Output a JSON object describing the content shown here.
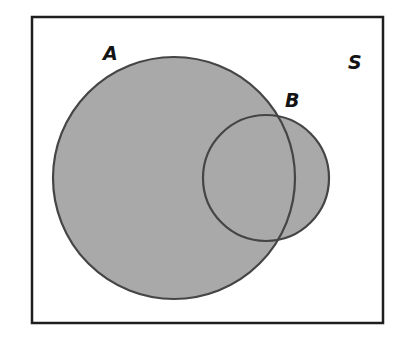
{
  "diagram": {
    "type": "venn",
    "universe": {
      "label": "S"
    },
    "sets": [
      {
        "id": "A",
        "label": "A",
        "shaded": true
      },
      {
        "id": "B",
        "label": "B",
        "shaded": true
      }
    ],
    "relation": "A and B overlap; union A ∪ B is shaded",
    "colors": {
      "fill": "#a9a9a9",
      "stroke": "#454545",
      "frame": "#1e1e1e",
      "background": "#ffffff"
    }
  }
}
